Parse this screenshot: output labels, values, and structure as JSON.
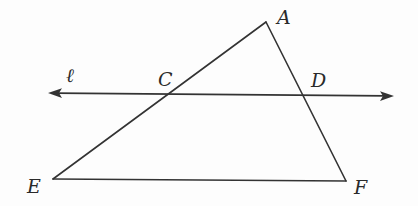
{
  "diagram": {
    "type": "geometry",
    "colors": {
      "stroke": "#333333",
      "label": "#2a2a2a",
      "background": "#fdfdfd"
    },
    "points": {
      "A": {
        "label": "A",
        "x": 266,
        "y": 22
      },
      "C": {
        "label": "C",
        "x": 170,
        "y": 94
      },
      "D": {
        "label": "D",
        "x": 302,
        "y": 95
      },
      "E": {
        "label": "E",
        "x": 53,
        "y": 179
      },
      "F": {
        "label": "F",
        "x": 346,
        "y": 181
      }
    },
    "line": {
      "label": "ℓ",
      "start": {
        "x": 48,
        "y": 93
      },
      "end": {
        "x": 394,
        "y": 96
      },
      "arrows": "both"
    },
    "segments": [
      {
        "from": "A",
        "to": "E"
      },
      {
        "from": "A",
        "to": "F"
      },
      {
        "from": "E",
        "to": "F"
      }
    ]
  }
}
